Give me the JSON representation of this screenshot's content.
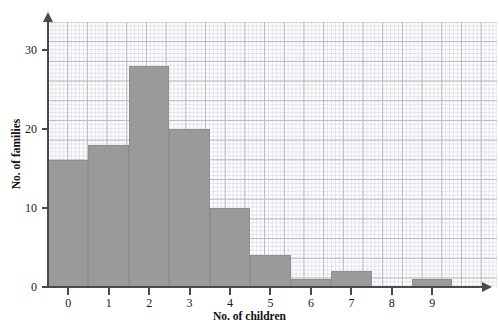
{
  "chart_data": {
    "type": "bar",
    "title": "",
    "xlabel": "No. of children",
    "ylabel": "No. of families",
    "categories": [
      "0",
      "1",
      "2",
      "3",
      "4",
      "5",
      "6",
      "7",
      "8",
      "9"
    ],
    "values": [
      16,
      18,
      28,
      20,
      10,
      4,
      1,
      2,
      0,
      1
    ],
    "xlim": [
      -0.5,
      10.6
    ],
    "ylim": [
      0,
      33.5
    ],
    "ytick_labels": [
      "0",
      "10",
      "20",
      "30"
    ],
    "ytick_values": [
      0,
      10,
      20,
      30
    ],
    "xtick_labels": [
      "0",
      "1",
      "2",
      "3",
      "4",
      "5",
      "6",
      "7",
      "8",
      "9"
    ],
    "grid": true,
    "legend": null,
    "bar_color": "#9a9a9a",
    "bar_edge_color": "#8e8e8e",
    "axis_color": "#4a4a4a",
    "grid_major_color": "#b9b9c4",
    "grid_minor_color": "#e2e2e9",
    "background_color": "#ffffff"
  },
  "axes": {
    "x_title": "No. of children",
    "y_title": "No. of families"
  },
  "top_caption": ""
}
